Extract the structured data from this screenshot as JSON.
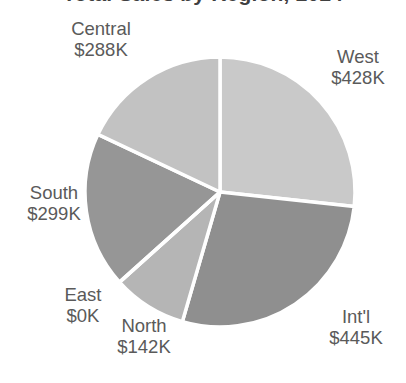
{
  "chart_data": {
    "type": "pie",
    "title": "Total Sales by Region, 2024",
    "title_clipped": true,
    "categories": [
      "West",
      "Int'l",
      "North",
      "East",
      "South",
      "Central"
    ],
    "values": [
      428,
      445,
      142,
      0,
      299,
      288
    ],
    "value_labels": [
      "$428K",
      "$445K",
      "$142K",
      "$0K",
      "$299K",
      "$288K"
    ],
    "unit": "K",
    "currency": "$",
    "total": 1602,
    "start_angle_deg": 0,
    "direction": "clockwise",
    "legend": "none",
    "labels_position": "outside",
    "slices": [
      {
        "name": "West",
        "value_label": "$428K",
        "value": 428,
        "color": "#c9c9c9",
        "start_deg": 0,
        "sweep_deg": 96.2
      },
      {
        "name": "Int'l",
        "value_label": "$445K",
        "value": 445,
        "color": "#8f8f8f",
        "start_deg": 96.2,
        "sweep_deg": 100.0
      },
      {
        "name": "North",
        "value_label": "$142K",
        "value": 142,
        "color": "#b5b5b5",
        "start_deg": 196.2,
        "sweep_deg": 31.9
      },
      {
        "name": "East",
        "value_label": "$0K",
        "value": 0,
        "color": "#a5a5a5",
        "start_deg": 228.1,
        "sweep_deg": 0.0
      },
      {
        "name": "South",
        "value_label": "$299K",
        "value": 299,
        "color": "#969696",
        "start_deg": 228.1,
        "sweep_deg": 67.2
      },
      {
        "name": "Central",
        "value_label": "$288K",
        "value": 288,
        "color": "#c2c2c2",
        "start_deg": 295.3,
        "sweep_deg": 64.7
      }
    ],
    "separator_color": "#ffffff",
    "separator_width": 3.5,
    "background": "#ffffff",
    "label_color": "#5a5a5a"
  },
  "labels": {
    "central": {
      "name": "Central",
      "value": "$288K"
    },
    "west": {
      "name": "West",
      "value": "$428K"
    },
    "south": {
      "name": "South",
      "value": "$299K"
    },
    "east": {
      "name": "East",
      "value": "$0K"
    },
    "north": {
      "name": "North",
      "value": "$142K"
    },
    "intl": {
      "name": "Int'l",
      "value": "$445K"
    }
  }
}
